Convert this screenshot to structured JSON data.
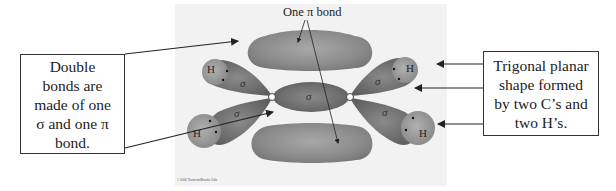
{
  "diagram": {
    "top_label": "One π bond",
    "left_callout": "Double\nbonds are\nmade of one\nσ and one π\nbond.",
    "right_callout": "Trigonal planar\nshape formed\nby two C’s and\ntwo H’s.",
    "atoms": {
      "carbon_left": "C",
      "carbon_right": "C",
      "h_upper_left": "H",
      "h_lower_left": "H",
      "h_upper_right": "H",
      "h_lower_right": "H"
    },
    "sigma_labels": {
      "upper_left": "σ",
      "lower_left": "σ",
      "center": "σ",
      "upper_right": "σ",
      "lower_right": "σ"
    },
    "copyright": "© 2004 Thomson/Brooks Cole"
  },
  "colors": {
    "pi_lobe": "#8a8a8a",
    "sigma_lobe": "#6e6e6e",
    "h_orbital": "#9a9a9a",
    "background": "#f2f2f2",
    "arrow": "#222222",
    "box_border": "#333333"
  }
}
